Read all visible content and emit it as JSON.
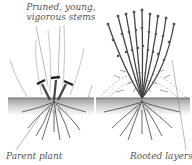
{
  "figure": {
    "labels": {
      "pruned_line1": "Pruned, young,",
      "pruned_line2": "vigorous stems",
      "parent": "Parent plant",
      "rooted": "Rooted layers"
    },
    "colors": {
      "ink": "#333333",
      "soil": "#b8b8b8",
      "stem_light": "#c8c8c8",
      "label": "#555555"
    }
  }
}
